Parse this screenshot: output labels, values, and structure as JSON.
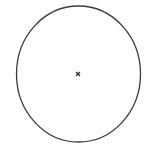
{
  "diagram": {
    "background": "#ffffff",
    "stroke_color": "#3a3a3a",
    "shapes": [
      {
        "type": "ellipse",
        "name": "circle-outline",
        "cx": 78.5,
        "cy": 74,
        "rx": 62,
        "ry": 68,
        "stroke_width": 1.3
      }
    ],
    "markers": [
      {
        "type": "x-mark",
        "name": "center-point",
        "x": 78,
        "y": 74,
        "size": 2
      }
    ]
  }
}
